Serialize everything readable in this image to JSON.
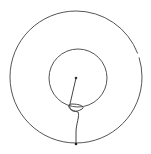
{
  "diagram": {
    "background": "#ffffff",
    "stroke_color": "#555555",
    "outer_circle": {
      "cx": 76,
      "cy": 77,
      "r": 66
    },
    "inner_circle": {
      "cx": 78,
      "cy": 78,
      "r": 29
    },
    "center_point": {
      "x": 76,
      "y": 78
    },
    "bottom_point": {
      "x": 76,
      "y": 144
    }
  }
}
